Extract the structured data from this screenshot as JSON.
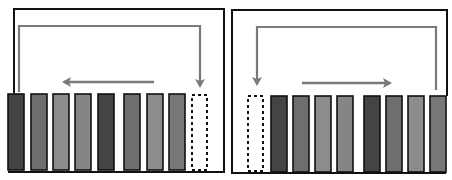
{
  "diagram": {
    "title": "",
    "colors": {
      "frame": "#111111",
      "arrow": "#7a7a7a",
      "dark": "#444444",
      "mid": "#6e6e6e",
      "light": "#8c8c8c",
      "empty": "#ffffff"
    },
    "panels": [
      {
        "name": "left-panel",
        "direction": "shift-left-wrap-right",
        "slots": [
          "dark",
          "mid",
          "light",
          "light",
          "dark",
          "mid",
          "light",
          "mid",
          "empty"
        ],
        "loop_arrow": "from first slot up, across, down into last (empty) slot",
        "shift_arrow": "leftward"
      },
      {
        "name": "right-panel",
        "direction": "shift-right-wrap-left",
        "slots": [
          "empty",
          "dark",
          "mid",
          "light",
          "light",
          "dark",
          "mid",
          "light",
          "mid"
        ],
        "loop_arrow": "from last slot up, across, down into first (empty) slot",
        "shift_arrow": "rightward"
      }
    ]
  }
}
